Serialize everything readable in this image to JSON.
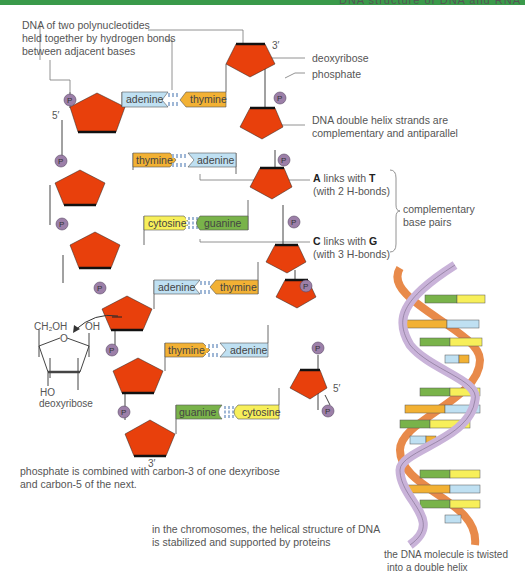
{
  "header": {
    "title": "DNA structure of DNA and RNA"
  },
  "colors": {
    "accent_bar": "#3a9a4a",
    "sugar": "#e8400c",
    "phosphate": "#9c7fa8",
    "adenine": "#bfe0f2",
    "thymine": "#f2b134",
    "cytosine": "#f7ef5a",
    "guanine": "#79b34a",
    "helix_backbone_1": "#c9b3d9",
    "helix_backbone_2": "#e88a4a"
  },
  "labels": {
    "polynucleotides": [
      "DNA of two polynucleotides",
      "held together by hydrogen bonds",
      "between adjacent bases"
    ],
    "deoxyribose": "deoxyribose",
    "phosphate": "phosphate",
    "antiparallel": [
      "DNA double helix strands are",
      "complementary and antiparallel"
    ],
    "at_link": {
      "a": "A",
      "mid": " links with ",
      "t": "T",
      "sub": "(with 2 H-bonds)"
    },
    "cg_link": {
      "c": "C",
      "mid": " links with ",
      "g": "G",
      "sub": "(with 3 H-bonds)"
    },
    "complementary": [
      "complementary",
      "base pairs"
    ],
    "phosphate_note": [
      "phosphate is combined with carbon-3 of one dexyribose",
      "and carbon-5 of the next."
    ],
    "chromosomes_note": [
      "in the chromosomes, the helical structure of DNA",
      "is stabilized and supported by proteins"
    ],
    "helix_note": [
      "the DNA molecule is twisted",
      "into a double helix"
    ],
    "deoxyribose_struct": {
      "ch2oh": "CH₂OH",
      "oh": "OH",
      "o": "O",
      "ho": "HO",
      "name": "deoxyribose"
    },
    "primes": {
      "top_right": "3′",
      "top_left": "5′",
      "bottom_left": "3′",
      "bottom_right": "5′"
    },
    "phosphate_symbol": "P"
  },
  "base_pairs": [
    {
      "left": "adenine",
      "right": "thymine"
    },
    {
      "left": "thymine",
      "right": "adenine"
    },
    {
      "left": "cytosine",
      "right": "guanine"
    },
    {
      "left": "adenine",
      "right": "thymine"
    },
    {
      "left": "thymine",
      "right": "adenine"
    },
    {
      "left": "guanine",
      "right": "cytosine"
    }
  ]
}
